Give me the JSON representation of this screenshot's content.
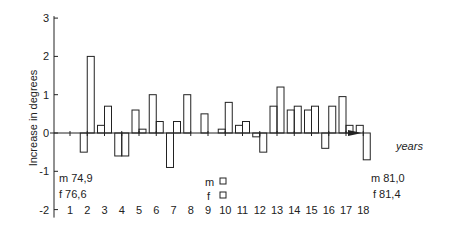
{
  "chart_data": {
    "type": "bar",
    "title": "",
    "xlabel": "years",
    "ylabel": "Increase in degrees",
    "ylim": [
      -2,
      3
    ],
    "yticks": [
      -2,
      -1,
      0,
      1,
      2,
      3
    ],
    "categories": [
      "1",
      "2",
      "3",
      "4",
      "5",
      "6",
      "7",
      "8",
      "9",
      "10",
      "11",
      "12",
      "13",
      "14",
      "15",
      "16",
      "17",
      "18"
    ],
    "series": [
      {
        "name": "m",
        "values": [
          null,
          -0.5,
          0.2,
          -0.6,
          0.6,
          1.0,
          -0.9,
          1.0,
          0.5,
          0.1,
          0.2,
          -0.1,
          0.7,
          0.6,
          0.6,
          -0.4,
          0.95,
          0.2
        ]
      },
      {
        "name": "f",
        "values": [
          null,
          2.0,
          0.7,
          -0.6,
          0.1,
          0.3,
          0.3,
          null,
          null,
          0.8,
          0.3,
          -0.5,
          1.2,
          0.7,
          0.7,
          0.7,
          0.2,
          -0.7
        ]
      }
    ],
    "annotations": {
      "start": {
        "m": "m 74,9",
        "f": "f 76,6"
      },
      "legend": {
        "m": "m",
        "f": "f"
      },
      "end": {
        "m": "m 81,0",
        "f": "f 81,4"
      }
    },
    "grid": false
  }
}
